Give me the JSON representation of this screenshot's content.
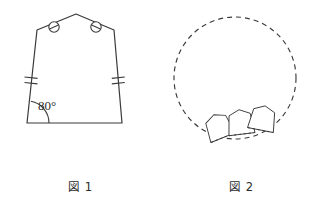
{
  "page": {
    "background_color": "#ffffff",
    "stroke_color": "#3a3a3a",
    "width": 322,
    "height": 208
  },
  "figure1": {
    "caption": "図 1",
    "shape_name": "pentagon-tile",
    "angle_label": "80°",
    "angle_value": 80,
    "angle_unit": "degrees",
    "angle_vertex": "bottom-left",
    "vertices": [
      {
        "name": "bottom-left",
        "x": 27,
        "y": 123
      },
      {
        "name": "bottom-right",
        "x": 122,
        "y": 123
      },
      {
        "name": "upper-right-shoulder",
        "x": 114,
        "y": 30
      },
      {
        "name": "apex",
        "x": 76,
        "y": 14
      },
      {
        "name": "upper-left-shoulder",
        "x": 37,
        "y": 30
      }
    ],
    "marks": {
      "circle_slash_left": {
        "name": "circle-slash-mark",
        "x": 54,
        "y": 27,
        "r": 5.2
      },
      "circle_slash_right": {
        "name": "circle-slash-mark",
        "x": 96,
        "y": 27,
        "r": 5.2
      },
      "double_tick_left": {
        "name": "double-tick-mark",
        "x": 31,
        "y": 80
      },
      "double_tick_right": {
        "name": "double-tick-mark",
        "x": 118,
        "y": 80
      },
      "angle_arc": {
        "name": "angle-arc",
        "cx": 27,
        "cy": 123,
        "r": 22
      }
    }
  },
  "figure2": {
    "caption": "図 2",
    "circle": {
      "name": "dashed-circle",
      "cx": 235,
      "cy": 78,
      "r": 61,
      "style": "dashed",
      "dash_pattern": "5 4"
    },
    "tiles": [
      {
        "name": "tile-1",
        "index": 1,
        "cx": 220,
        "cy": 130,
        "rotation": -22
      },
      {
        "name": "tile-2",
        "index": 2,
        "cx": 240,
        "cy": 126,
        "rotation": -8
      },
      {
        "name": "tile-3",
        "index": 3,
        "cx": 260,
        "cy": 122,
        "rotation": 10
      }
    ],
    "tile_count": 3,
    "tile_shape_reference": "figure1.shape_name"
  }
}
